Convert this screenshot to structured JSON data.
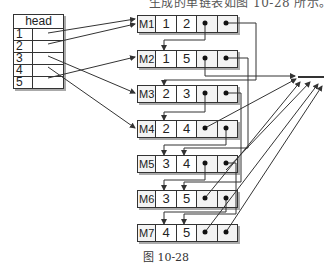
{
  "top_text": "生成的单链表如图 10-28 所示。",
  "head_table": {
    "title": "head",
    "rows": [
      "1",
      "2",
      "3",
      "4",
      "5"
    ]
  },
  "nodes": [
    {
      "label": "M1",
      "a": "1",
      "b": "2",
      "top": 15
    },
    {
      "label": "M2",
      "a": "1",
      "b": "5",
      "top": 50
    },
    {
      "label": "M3",
      "a": "2",
      "b": "3",
      "top": 85
    },
    {
      "label": "M4",
      "a": "2",
      "b": "4",
      "top": 120
    },
    {
      "label": "M5",
      "a": "3",
      "b": "4",
      "top": 155
    },
    {
      "label": "M6",
      "a": "3",
      "b": "5",
      "top": 190
    },
    {
      "label": "M7",
      "a": "4",
      "b": "5",
      "top": 224
    }
  ],
  "null_marker": "null",
  "caption": "图 10-28",
  "colors": {
    "line": "#333333",
    "node_fill": "#f3f3f3",
    "shadow": "#aaaaaa"
  }
}
